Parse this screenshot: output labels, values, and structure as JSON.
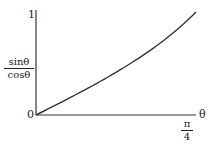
{
  "chart_data": {
    "type": "line",
    "title": "",
    "xlabel": "θ",
    "ylabel": "sinθ / cosθ",
    "ylabel_numerator": "sinθ",
    "ylabel_denominator": "cosθ",
    "x_tick_labels": [
      {
        "numerator": "π",
        "denominator": "4",
        "value": 0.7854
      }
    ],
    "y_tick_labels": [
      "0",
      "1"
    ],
    "origin_label": "0",
    "xlim": [
      0,
      0.7854
    ],
    "ylim": [
      0,
      1
    ],
    "grid": false,
    "series": [
      {
        "name": "tan θ",
        "x": [
          0,
          0.1,
          0.2,
          0.3,
          0.4,
          0.5,
          0.6,
          0.7,
          0.7854
        ],
        "y": [
          0,
          0.1003,
          0.2027,
          0.3093,
          0.4228,
          0.5463,
          0.6841,
          0.8423,
          1.0
        ]
      }
    ],
    "colors": {
      "axis": "#333333",
      "curve": "#333333"
    }
  },
  "labels": {
    "y_top": "1",
    "origin": "0",
    "y_num": "sinθ",
    "y_den": "cosθ",
    "x_num": "π",
    "x_den": "4",
    "x_axis": "θ"
  }
}
